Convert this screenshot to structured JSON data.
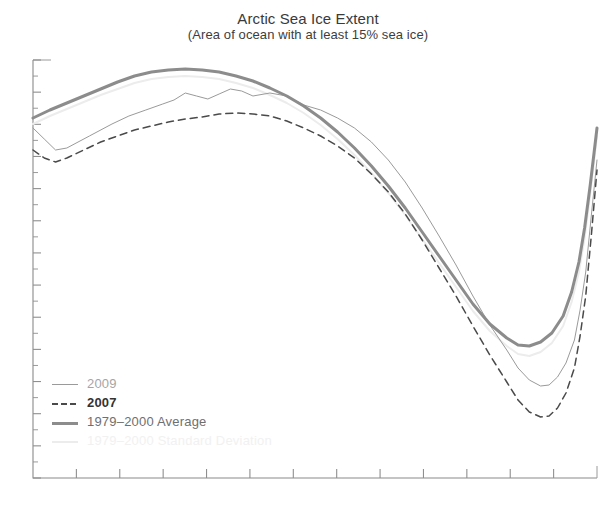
{
  "chart_data": {
    "type": "line",
    "title": "Arctic Sea Ice Extent",
    "subtitle": "(Area of ocean with at least 15% sea ice)",
    "xlabel": "",
    "ylabel": "",
    "grid": false,
    "legend_position": "lower-left",
    "x_tick_count": 12,
    "x_tick_labels": [],
    "y_tick_labels": [],
    "axis_note": "Axis tick labels are not rendered in this crop; ticks only.",
    "series": [
      {
        "name": "2009",
        "style": "solid-thin",
        "color": "#9a9a9a",
        "points": [
          [
            0.0,
            128
          ],
          [
            0.02,
            139
          ],
          [
            0.04,
            150
          ],
          [
            0.06,
            148
          ],
          [
            0.1,
            136
          ],
          [
            0.14,
            124
          ],
          [
            0.17,
            116
          ],
          [
            0.2,
            110
          ],
          [
            0.23,
            104
          ],
          [
            0.25,
            100
          ],
          [
            0.27,
            93
          ],
          [
            0.29,
            96
          ],
          [
            0.31,
            99
          ],
          [
            0.33,
            94
          ],
          [
            0.35,
            89
          ],
          [
            0.37,
            91
          ],
          [
            0.39,
            96
          ],
          [
            0.42,
            93
          ],
          [
            0.45,
            96
          ],
          [
            0.48,
            105
          ],
          [
            0.51,
            110
          ],
          [
            0.54,
            118
          ],
          [
            0.57,
            128
          ],
          [
            0.6,
            142
          ],
          [
            0.63,
            160
          ],
          [
            0.66,
            182
          ],
          [
            0.69,
            208
          ],
          [
            0.72,
            236
          ],
          [
            0.75,
            265
          ],
          [
            0.78,
            296
          ],
          [
            0.81,
            325
          ],
          [
            0.84,
            350
          ],
          [
            0.86,
            368
          ],
          [
            0.88,
            380
          ],
          [
            0.9,
            386
          ],
          [
            0.915,
            385
          ],
          [
            0.93,
            377
          ],
          [
            0.945,
            363
          ],
          [
            0.96,
            340
          ],
          [
            0.97,
            310
          ],
          [
            0.98,
            272
          ],
          [
            0.99,
            215
          ],
          [
            1.0,
            160
          ]
        ]
      },
      {
        "name": "2007",
        "style": "dashed",
        "color": "#4a4a4a",
        "points": [
          [
            0.0,
            150
          ],
          [
            0.02,
            158
          ],
          [
            0.04,
            162
          ],
          [
            0.06,
            158
          ],
          [
            0.09,
            150
          ],
          [
            0.12,
            142
          ],
          [
            0.15,
            136
          ],
          [
            0.18,
            130
          ],
          [
            0.21,
            126
          ],
          [
            0.24,
            122
          ],
          [
            0.27,
            119
          ],
          [
            0.3,
            117
          ],
          [
            0.33,
            114
          ],
          [
            0.36,
            113
          ],
          [
            0.39,
            114
          ],
          [
            0.42,
            116
          ],
          [
            0.45,
            121
          ],
          [
            0.48,
            128
          ],
          [
            0.51,
            136
          ],
          [
            0.54,
            146
          ],
          [
            0.57,
            158
          ],
          [
            0.6,
            174
          ],
          [
            0.63,
            192
          ],
          [
            0.66,
            214
          ],
          [
            0.69,
            240
          ],
          [
            0.72,
            268
          ],
          [
            0.75,
            296
          ],
          [
            0.78,
            326
          ],
          [
            0.81,
            355
          ],
          [
            0.84,
            382
          ],
          [
            0.86,
            400
          ],
          [
            0.88,
            412
          ],
          [
            0.9,
            417
          ],
          [
            0.915,
            416
          ],
          [
            0.93,
            408
          ],
          [
            0.945,
            393
          ],
          [
            0.96,
            368
          ],
          [
            0.97,
            336
          ],
          [
            0.98,
            296
          ],
          [
            0.99,
            235
          ],
          [
            1.0,
            170
          ]
        ]
      },
      {
        "name": "1979–2000 Average",
        "style": "solid-thick",
        "color": "#8c8c8c",
        "points": [
          [
            0.0,
            118
          ],
          [
            0.03,
            110
          ],
          [
            0.06,
            103
          ],
          [
            0.09,
            96
          ],
          [
            0.12,
            89
          ],
          [
            0.15,
            82
          ],
          [
            0.18,
            76
          ],
          [
            0.21,
            72
          ],
          [
            0.24,
            70
          ],
          [
            0.27,
            69
          ],
          [
            0.3,
            70
          ],
          [
            0.33,
            72
          ],
          [
            0.36,
            76
          ],
          [
            0.39,
            81
          ],
          [
            0.42,
            88
          ],
          [
            0.45,
            96
          ],
          [
            0.48,
            106
          ],
          [
            0.51,
            118
          ],
          [
            0.54,
            132
          ],
          [
            0.57,
            148
          ],
          [
            0.6,
            166
          ],
          [
            0.63,
            186
          ],
          [
            0.66,
            208
          ],
          [
            0.69,
            232
          ],
          [
            0.72,
            256
          ],
          [
            0.75,
            280
          ],
          [
            0.78,
            304
          ],
          [
            0.81,
            324
          ],
          [
            0.84,
            338
          ],
          [
            0.86,
            345
          ],
          [
            0.88,
            346
          ],
          [
            0.9,
            342
          ],
          [
            0.92,
            333
          ],
          [
            0.94,
            316
          ],
          [
            0.955,
            292
          ],
          [
            0.968,
            262
          ],
          [
            0.978,
            228
          ],
          [
            0.988,
            185
          ],
          [
            1.0,
            128
          ]
        ]
      },
      {
        "name": "1979–2000 Standard Deviation",
        "style": "solid-faint",
        "color": "#ececec",
        "points": [
          [
            0.0,
            124
          ],
          [
            0.03,
            116
          ],
          [
            0.06,
            109
          ],
          [
            0.09,
            102
          ],
          [
            0.12,
            95
          ],
          [
            0.15,
            89
          ],
          [
            0.18,
            83
          ],
          [
            0.21,
            79
          ],
          [
            0.24,
            77
          ],
          [
            0.27,
            76
          ],
          [
            0.3,
            77
          ],
          [
            0.33,
            79
          ],
          [
            0.36,
            83
          ],
          [
            0.39,
            88
          ],
          [
            0.42,
            95
          ],
          [
            0.45,
            103
          ],
          [
            0.48,
            113
          ],
          [
            0.51,
            125
          ],
          [
            0.54,
            139
          ],
          [
            0.57,
            155
          ],
          [
            0.6,
            173
          ],
          [
            0.63,
            193
          ],
          [
            0.66,
            215
          ],
          [
            0.69,
            239
          ],
          [
            0.72,
            263
          ],
          [
            0.75,
            287
          ],
          [
            0.78,
            311
          ],
          [
            0.81,
            331
          ],
          [
            0.84,
            346
          ],
          [
            0.86,
            354
          ],
          [
            0.88,
            356
          ],
          [
            0.9,
            352
          ],
          [
            0.92,
            343
          ],
          [
            0.94,
            326
          ],
          [
            0.955,
            302
          ],
          [
            0.968,
            272
          ],
          [
            0.978,
            238
          ],
          [
            0.988,
            194
          ],
          [
            1.0,
            136
          ]
        ]
      }
    ]
  },
  "legend": {
    "entries": [
      {
        "label": "2009"
      },
      {
        "label": "2007"
      },
      {
        "label": "1979–2000 Average"
      },
      {
        "label": "1979–2000 Standard Deviation"
      }
    ]
  }
}
